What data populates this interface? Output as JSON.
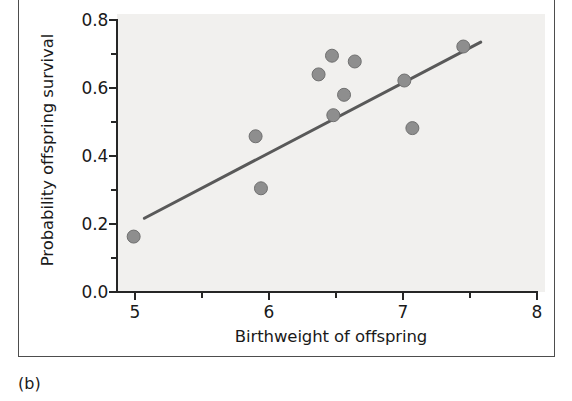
{
  "figure": {
    "panel_label": "(b)",
    "background_color": "#ffffff",
    "plot_background_color": "#f1f0ee",
    "frame_color": "#4d4d4d"
  },
  "chart_data": {
    "type": "scatter",
    "title": "",
    "xlabel": "Birthweight of offspring",
    "ylabel": "Probability offspring survival",
    "xlim": [
      4.7,
      8.0
    ],
    "ylim": [
      0.0,
      0.8
    ],
    "xticks": [
      5,
      6,
      7,
      8
    ],
    "xtick_labels": [
      "5",
      "6",
      "7",
      "8"
    ],
    "xticks_minor": [
      5.5,
      6.5,
      7.5
    ],
    "yticks": [
      0.0,
      0.2,
      0.4,
      0.6,
      0.8
    ],
    "ytick_labels": [
      "0.0",
      "0.2",
      "0.4",
      "0.6",
      "0.8"
    ],
    "yticks_minor": [
      0.1,
      0.3,
      0.5,
      0.7
    ],
    "grid": false,
    "legend": null,
    "marker_color": "#8e8e8e",
    "marker_edge_color": "#707070",
    "marker_size": 13,
    "points": [
      {
        "x": 4.99,
        "y": 0.163
      },
      {
        "x": 5.9,
        "y": 0.458
      },
      {
        "x": 5.94,
        "y": 0.305
      },
      {
        "x": 6.37,
        "y": 0.64
      },
      {
        "x": 6.47,
        "y": 0.695
      },
      {
        "x": 6.48,
        "y": 0.52
      },
      {
        "x": 6.56,
        "y": 0.58
      },
      {
        "x": 6.64,
        "y": 0.678
      },
      {
        "x": 7.01,
        "y": 0.622
      },
      {
        "x": 7.07,
        "y": 0.482
      },
      {
        "x": 7.45,
        "y": 0.722
      }
    ],
    "trendline": {
      "color": "#595959",
      "width": 3,
      "x_start": 5.07,
      "y_start": 0.217,
      "x_end": 7.58,
      "y_end": 0.735
    }
  }
}
